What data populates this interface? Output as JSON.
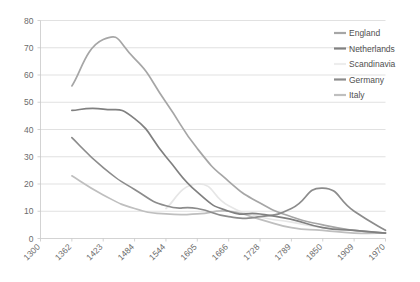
{
  "chart_data": {
    "type": "line",
    "title": "",
    "subtitle": "",
    "xlabel": "",
    "ylabel": "",
    "xlim": [
      1300,
      1970
    ],
    "ylim": [
      0,
      80
    ],
    "grid": true,
    "legend_position": "right",
    "x": [
      1300,
      1362,
      1423,
      1484,
      1544,
      1605,
      1666,
      1728,
      1789,
      1850,
      1909,
      1970
    ],
    "xtick_labels": [
      "1300",
      "1362",
      "1423",
      "1484",
      "1544",
      "1605",
      "1666",
      "1728",
      "1789",
      "1850",
      "1909",
      "1970"
    ],
    "ytick_labels": [
      "0",
      "10",
      "20",
      "30",
      "40",
      "50",
      "60",
      "70",
      "80"
    ],
    "ytick_values": [
      0,
      10,
      20,
      30,
      40,
      50,
      60,
      70,
      80
    ],
    "series": [
      {
        "name": "England",
        "color": "#a6a6a6",
        "values": [
          null,
          56,
          73,
          66,
          50,
          33,
          21,
          13,
          8,
          5,
          3,
          2
        ]
      },
      {
        "name": "Netherlands",
        "color": "#808080",
        "values": [
          null,
          47,
          47.5,
          44,
          30,
          17,
          10,
          9,
          7,
          4,
          3,
          2
        ]
      },
      {
        "name": "Scandinavia",
        "color": "#e6e6e6",
        "values": [
          null,
          null,
          null,
          null,
          11,
          20,
          12,
          8,
          6,
          4,
          3,
          2
        ]
      },
      {
        "name": "Germany",
        "color": "#8c8c8c",
        "values": [
          null,
          37,
          26,
          18,
          12,
          11,
          8,
          8,
          11,
          18.5,
          10,
          3
        ]
      },
      {
        "name": "Italy",
        "color": "#bfbfbf",
        "values": [
          null,
          23,
          16,
          11,
          9,
          9,
          10,
          7,
          4,
          3,
          2,
          2
        ]
      }
    ]
  },
  "legend": {
    "entries": [
      {
        "label": "England",
        "color": "#a6a6a6"
      },
      {
        "label": "Netherlands",
        "color": "#808080"
      },
      {
        "label": "Scandinavia",
        "color": "#ededed"
      },
      {
        "label": "Germany",
        "color": "#8c8c8c"
      },
      {
        "label": "Italy",
        "color": "#bfbfbf"
      }
    ]
  },
  "axes": {
    "y_ticks": [
      "80",
      "70",
      "60",
      "50",
      "40",
      "30",
      "20",
      "10",
      "0"
    ],
    "x_ticks": [
      "1300",
      "1362",
      "1423",
      "1484",
      "1544",
      "1605",
      "1666",
      "1728",
      "1789",
      "1850",
      "1909",
      "1970"
    ]
  }
}
